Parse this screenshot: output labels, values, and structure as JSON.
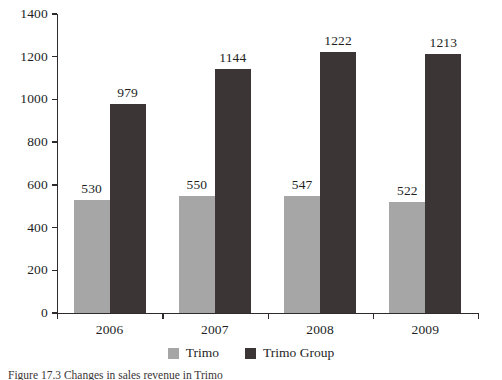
{
  "chart_data": {
    "type": "bar",
    "title": "",
    "subtitle": "",
    "xlabel": "",
    "ylabel": "",
    "categories": [
      "2006",
      "2007",
      "2008",
      "2009"
    ],
    "series": [
      {
        "name": "Trimo",
        "color": "#a6a6a6",
        "values": [
          530,
          550,
          547,
          522
        ]
      },
      {
        "name": "Trimo Group",
        "color": "#3b3535",
        "values": [
          979,
          1144,
          1222,
          1213
        ]
      }
    ],
    "ylim": [
      0,
      1400
    ],
    "y_ticks": [
      0,
      200,
      400,
      600,
      800,
      1000,
      1200,
      1400
    ],
    "y_tick_labels": [
      "0",
      "200",
      "400",
      "600",
      "800",
      "1000",
      "1200",
      "1400"
    ],
    "grid": false,
    "legend_position": "bottom",
    "data_labels": true,
    "data_label_values": [
      [
        "530",
        "979"
      ],
      [
        "550",
        "1144"
      ],
      [
        "547",
        "1222"
      ],
      [
        "522",
        "1213"
      ]
    ]
  },
  "legend": {
    "items": [
      {
        "label": "Trimo",
        "color": "#a6a6a6"
      },
      {
        "label": "Trimo Group",
        "color": "#3b3535"
      }
    ]
  },
  "caption": {
    "label": "Figure 17.3",
    "text": "Figure 17.3  Changes in sales revenue in Trimo"
  }
}
